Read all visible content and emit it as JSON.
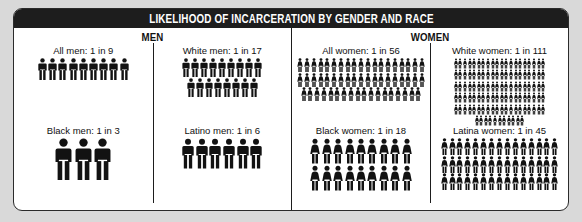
{
  "header": {
    "title": "LIKELIHOOD OF INCARCERATION BY GENDER AND RACE"
  },
  "sections": {
    "men": {
      "title": "MEN"
    },
    "women": {
      "title": "WOMEN"
    }
  },
  "colors": {
    "header_background": "#1d1d1d",
    "header_text": "#ffffff",
    "figure": "#121212",
    "panel_background": "#ffffff",
    "page_background": "#d9d9d9",
    "border": "#2b2b2b"
  },
  "chart_data": {
    "type": "pictogram",
    "title": "LIKELIHOOD OF INCARCERATION BY GENDER AND RACE",
    "unit": "1 in N people",
    "note": "Each icon represents one person; total icons per group equals the denominator N.",
    "groups": [
      {
        "key": "all-men",
        "gender": "men",
        "label": "All men: 1 in 9",
        "category": "All men",
        "ratio": "1 in 9",
        "denominator": 9,
        "probability": 0.1111,
        "icon": "man",
        "icon_size": 22,
        "per_row": 9
      },
      {
        "key": "white-men",
        "gender": "men",
        "label": "White men: 1 in 17",
        "category": "White men",
        "ratio": "1 in 17",
        "denominator": 17,
        "probability": 0.0588,
        "icon": "man",
        "icon_size": 19,
        "per_row": 9
      },
      {
        "key": "black-men",
        "gender": "men",
        "label": "Black men: 1 in 3",
        "category": "Black men",
        "ratio": "1 in 3",
        "denominator": 3,
        "probability": 0.3333,
        "icon": "man",
        "icon_size": 42,
        "per_row": 3
      },
      {
        "key": "latino-men",
        "gender": "men",
        "label": "Latino men: 1 in 6",
        "category": "Latino men",
        "ratio": "1 in 6",
        "denominator": 6,
        "probability": 0.1667,
        "icon": "man",
        "icon_size": 31,
        "per_row": 6
      },
      {
        "key": "all-women",
        "gender": "women",
        "label": "All women: 1 in 56",
        "category": "All women",
        "ratio": "1 in 56",
        "denominator": 56,
        "probability": 0.0179,
        "icon": "woman",
        "icon_size": 14,
        "per_row": 19
      },
      {
        "key": "white-women",
        "gender": "women",
        "label": "White women: 1 in 111",
        "category": "White women",
        "ratio": "1 in 111",
        "denominator": 111,
        "probability": 0.009,
        "icon": "woman",
        "icon_size": 11,
        "per_row": 20
      },
      {
        "key": "black-women",
        "gender": "women",
        "label": "Black women: 1 in 18",
        "category": "Black women",
        "ratio": "1 in 18",
        "denominator": 18,
        "probability": 0.0556,
        "icon": "woman",
        "icon_size": 26,
        "per_row": 9
      },
      {
        "key": "latina-women",
        "gender": "women",
        "label": "Latina women: 1 in 45",
        "category": "Latina women",
        "ratio": "1 in 45",
        "denominator": 45,
        "probability": 0.0222,
        "icon": "woman",
        "icon_size": 17,
        "per_row": 15
      }
    ]
  }
}
